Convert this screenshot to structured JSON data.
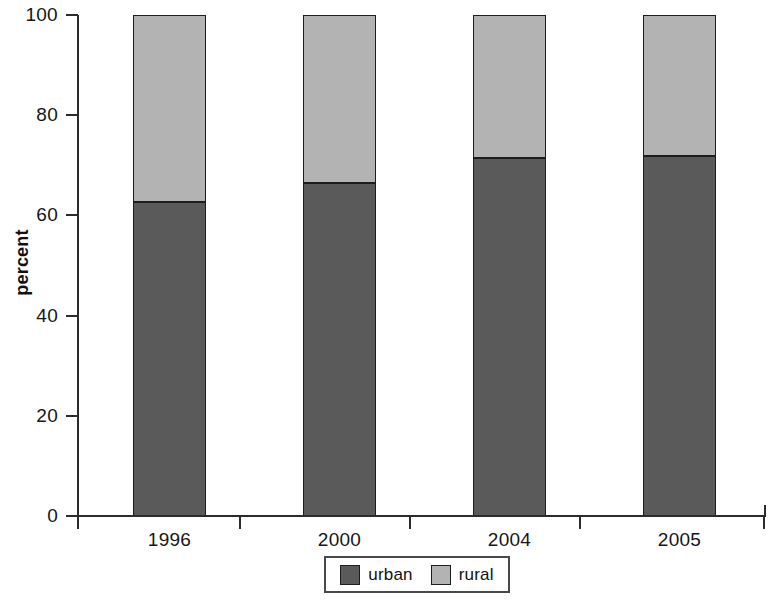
{
  "chart_data": {
    "type": "bar",
    "subtype": "stacked-percent",
    "title": "",
    "xlabel": "",
    "ylabel": "percent",
    "ylim": [
      0,
      100
    ],
    "yticks": [
      0,
      20,
      40,
      60,
      80,
      100
    ],
    "ytick_labels": [
      "0",
      "20",
      "40",
      "60",
      "80",
      "100"
    ],
    "categories": [
      "1996",
      "2000",
      "2004",
      "2005"
    ],
    "grid": false,
    "legend_position": "bottom-center",
    "series": [
      {
        "name": "urban",
        "color": "#5a5a5a",
        "values": [
          62.6,
          66.4,
          71.4,
          71.8
        ]
      },
      {
        "name": "rural",
        "color": "#b3b3b3",
        "values": [
          37.4,
          33.6,
          28.6,
          28.2
        ]
      }
    ]
  },
  "axes": {
    "y_title": "percent"
  },
  "legend": {
    "items": [
      {
        "label": "urban",
        "color": "#5a5a5a"
      },
      {
        "label": "rural",
        "color": "#b3b3b3"
      }
    ]
  },
  "colors": {
    "urban": "#5a5a5a",
    "rural": "#b3b3b3",
    "axis": "#2b2b2b",
    "outline": "#1d1d1d",
    "background": "#ffffff"
  }
}
